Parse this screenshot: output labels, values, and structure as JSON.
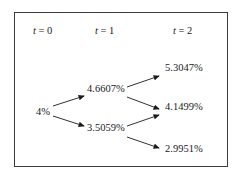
{
  "diagram": {
    "type": "binomial-interest-rate-tree",
    "headers": [
      {
        "var": "t",
        "eq": " = 0"
      },
      {
        "var": "t",
        "eq": " = 1"
      },
      {
        "var": "t",
        "eq": " = 2"
      }
    ],
    "nodes": {
      "t0": "4%",
      "t1_up": "4.6607%",
      "t1_down": "3.5059%",
      "t2_uu": "5.3047%",
      "t2_ud": "4.1499%",
      "t2_dd": "2.9951%"
    },
    "edges": [
      [
        "t0",
        "t1_up"
      ],
      [
        "t0",
        "t1_down"
      ],
      [
        "t1_up",
        "t2_uu"
      ],
      [
        "t1_up",
        "t2_ud"
      ],
      [
        "t1_down",
        "t2_ud"
      ],
      [
        "t1_down",
        "t2_dd"
      ]
    ]
  }
}
